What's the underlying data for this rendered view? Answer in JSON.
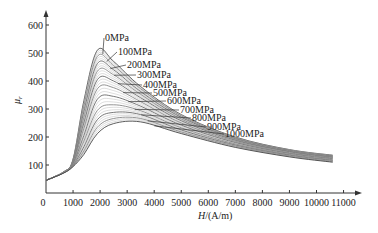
{
  "chart_data": {
    "type": "line",
    "title": "",
    "xlabel": "H/(A/m)",
    "xlabel_italic_part": "H",
    "xlabel_unit_part": "/(A/m)",
    "ylabel": "μr",
    "xlim": [
      0,
      11000
    ],
    "ylim": [
      0,
      600
    ],
    "xticks": [
      0,
      1000,
      2000,
      3000,
      4000,
      5000,
      6000,
      7000,
      8000,
      9000,
      10000,
      11000
    ],
    "yticks": [
      100,
      200,
      300,
      400,
      500,
      600
    ],
    "grid": false,
    "legend_position": "inline labels with leader lines",
    "line_color": "#444444",
    "x": [
      0,
      650,
      1000,
      1400,
      1900,
      2500,
      3500,
      5000,
      7000,
      9000,
      10600
    ],
    "series": [
      {
        "name": "0MPa",
        "peak": [
          1900,
          510
        ],
        "values": [
          45,
          75,
          120,
          330,
          510,
          470,
          380,
          280,
          200,
          155,
          135
        ]
      },
      {
        "name": "100MPa",
        "peak": [
          1950,
          490
        ],
        "values": [
          45,
          75,
          118,
          310,
          488,
          455,
          372,
          275,
          197,
          153,
          133
        ]
      },
      {
        "name": "200MPa",
        "peak": [
          2000,
          465
        ],
        "values": [
          45,
          75,
          115,
          290,
          462,
          440,
          362,
          270,
          194,
          151,
          131
        ]
      },
      {
        "name": "300MPa",
        "peak": [
          2050,
          440
        ],
        "values": [
          45,
          75,
          112,
          270,
          435,
          422,
          352,
          264,
          191,
          149,
          129
        ]
      },
      {
        "name": "400MPa",
        "peak": [
          2100,
          410
        ],
        "values": [
          45,
          74,
          110,
          250,
          405,
          400,
          340,
          258,
          188,
          147,
          127
        ]
      },
      {
        "name": "500MPa",
        "peak": [
          2200,
          380
        ],
        "values": [
          45,
          74,
          107,
          230,
          372,
          376,
          326,
          250,
          184,
          144,
          125
        ]
      },
      {
        "name": "600MPa",
        "peak": [
          2300,
          345
        ],
        "values": [
          45,
          73,
          104,
          205,
          335,
          345,
          310,
          242,
          180,
          141,
          122
        ]
      },
      {
        "name": "700MPa",
        "peak": [
          2450,
          315
        ],
        "values": [
          45,
          73,
          101,
          185,
          295,
          315,
          294,
          233,
          175,
          138,
          119
        ]
      },
      {
        "name": "800MPa",
        "peak": [
          2600,
          290
        ],
        "values": [
          45,
          72,
          98,
          165,
          262,
          288,
          280,
          225,
          171,
          135,
          116
        ]
      },
      {
        "name": "900MPa",
        "peak": [
          2750,
          270
        ],
        "values": [
          45,
          72,
          96,
          150,
          235,
          266,
          266,
          218,
          167,
          132,
          113
        ]
      },
      {
        "name": "1000MPa",
        "peak": [
          2900,
          255
        ],
        "values": [
          45,
          71,
          94,
          138,
          212,
          248,
          254,
          212,
          163,
          129,
          110
        ]
      }
    ]
  },
  "labels": {
    "origin": "0",
    "y_axis_symbol": "μ",
    "y_axis_subscript": "r"
  }
}
